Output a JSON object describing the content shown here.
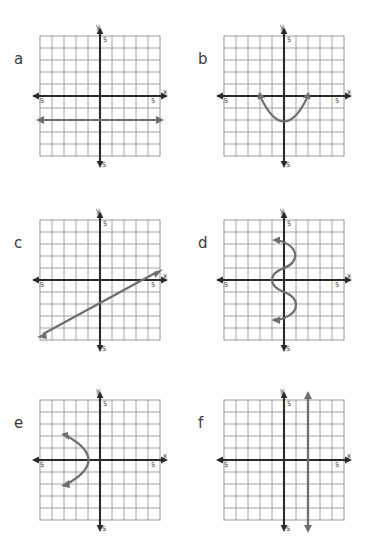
{
  "worksheet": {
    "title": "Graph identification worksheet",
    "background_color": "#ffffff",
    "grid_color": "#8d8d8d",
    "axis_color": "#2b2b2b",
    "curve_color": "#6f6f6f",
    "label_color": "#3a3a3a",
    "axis_max_label": "5",
    "axis_min_label": "-5",
    "x_axis_label": "x",
    "y_axis_label": "y",
    "grid_cells_per_side": 10,
    "axis_range": [
      -5,
      5
    ]
  },
  "graphs": [
    {
      "id": "a",
      "label": "a",
      "type": "line",
      "description": "horizontal line",
      "equation": "y = -2",
      "x_tick_label": "5",
      "x_neg_tick_label": "-5",
      "y_tick_label": "5",
      "y_neg_tick_label": "-5",
      "x_axis_label": "x",
      "y_axis_label": "y",
      "curve_points": [
        [
          -5,
          -2
        ],
        [
          5,
          -2
        ]
      ],
      "arrow_start": true,
      "arrow_end": true
    },
    {
      "id": "b",
      "label": "b",
      "type": "parabola",
      "description": "upward opening parabola",
      "equation": "y = x^2 - 3",
      "x_tick_label": "5",
      "x_neg_tick_label": "-5",
      "y_tick_label": "5",
      "y_neg_tick_label": "-5",
      "x_axis_label": "x",
      "y_axis_label": "y",
      "vertex": [
        0,
        -3
      ],
      "curve_points": [
        [
          -2,
          0
        ],
        [
          -1.6,
          -1.2
        ],
        [
          -1.0,
          -2.3
        ],
        [
          0,
          -3
        ],
        [
          1.0,
          -2.3
        ],
        [
          1.6,
          -1.2
        ],
        [
          2,
          0
        ]
      ],
      "arrow_start": true,
      "arrow_end": true
    },
    {
      "id": "c",
      "label": "c",
      "type": "line",
      "description": "diagonal line positive slope",
      "equation": "y = 0.5x - 2",
      "x_tick_label": "5",
      "x_neg_tick_label": "-5",
      "y_tick_label": "5",
      "y_neg_tick_label": "-5",
      "x_axis_label": "x",
      "y_axis_label": "y",
      "curve_points": [
        [
          -5,
          -4.5
        ],
        [
          5,
          0.5
        ]
      ],
      "arrow_start": true,
      "arrow_end": true
    },
    {
      "id": "d",
      "label": "d",
      "type": "sinusoid-vertical",
      "description": "sideways sine wave oscillating about the y-axis",
      "equation": "x = sin(y)",
      "x_tick_label": "5",
      "x_neg_tick_label": "-5",
      "y_tick_label": "5",
      "y_neg_tick_label": "-5",
      "x_axis_label": "x",
      "y_axis_label": "y",
      "amplitude": 1,
      "y_start": -3,
      "y_end": 3,
      "arrow_start": true,
      "arrow_end": true
    },
    {
      "id": "e",
      "label": "e",
      "type": "parabola-sideways",
      "description": "left opening parabola with vertex at origin",
      "equation": "x = -y^2",
      "x_tick_label": "5",
      "x_neg_tick_label": "-5",
      "y_tick_label": "5",
      "y_neg_tick_label": "-5",
      "x_axis_label": "x",
      "y_axis_label": "y",
      "vertex": [
        0,
        0
      ],
      "curve_points": [
        [
          -3,
          2
        ],
        [
          -2.2,
          1.55
        ],
        [
          -1.2,
          1.0
        ],
        [
          -0.3,
          0.4
        ],
        [
          0,
          0
        ],
        [
          -0.3,
          -0.4
        ],
        [
          -1.2,
          -1.0
        ],
        [
          -2.2,
          -1.55
        ],
        [
          -3,
          -2
        ]
      ],
      "arrow_start": true,
      "arrow_end": true
    },
    {
      "id": "f",
      "label": "f",
      "type": "line",
      "description": "vertical line",
      "equation": "x = 2",
      "x_tick_label": "5",
      "x_neg_tick_label": "-5",
      "y_tick_label": "5",
      "y_neg_tick_label": "-5",
      "x_axis_label": "x",
      "y_axis_label": "y",
      "curve_points": [
        [
          2,
          -5
        ],
        [
          2,
          5
        ]
      ],
      "arrow_start": true,
      "arrow_end": true
    }
  ]
}
